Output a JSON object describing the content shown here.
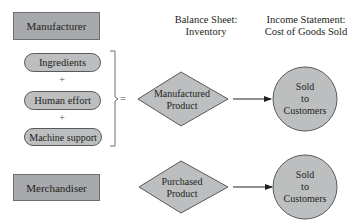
{
  "headers": {
    "balance_sheet": [
      "Balance Sheet:",
      "Inventory"
    ],
    "income_statement": [
      "Income Statement:",
      "Cost of Goods Sold"
    ]
  },
  "manufacturer": {
    "label": "Manufacturer",
    "inputs": [
      {
        "label": "Ingredients"
      },
      {
        "label": "Human effort"
      },
      {
        "label": "Machine support"
      }
    ],
    "operator_plus": "+",
    "operator_equals": "=",
    "product": [
      "Manufactured",
      "Product"
    ],
    "outcome": [
      "Sold",
      "to",
      "Customers"
    ]
  },
  "merchandiser": {
    "label": "Merchandiser",
    "product": [
      "Purchased",
      "Product"
    ],
    "outcome": [
      "Sold",
      "to",
      "Customers"
    ]
  },
  "colors": {
    "box_fill": "#a7a9ac",
    "pill_fill": "#bcbec0",
    "shape_fill": "#bcbec0",
    "stroke": "#58595b",
    "text": "#231f20"
  }
}
